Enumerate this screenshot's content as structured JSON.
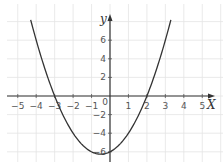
{
  "chart_data": {
    "type": "line",
    "title": "",
    "xlabel": "X",
    "ylabel": "y",
    "function": "y = x^2 + x - 6",
    "xlim": [
      -5.5,
      5.7
    ],
    "ylim": [
      -7,
      8.5
    ],
    "x_ticks": [
      -5,
      -4,
      -3,
      -2,
      -1,
      0,
      1,
      2,
      3,
      4,
      5
    ],
    "x_tick_labels": [
      "−5",
      "−4",
      "−3",
      "−2",
      "−1",
      "0",
      "1",
      "2",
      "3",
      "4",
      "5"
    ],
    "y_ticks": [
      -6,
      -4,
      -2,
      2,
      4,
      6
    ],
    "y_tick_labels": [
      "−6",
      "−4",
      "−2",
      "2",
      "4",
      "6"
    ],
    "grid": true,
    "grid_x_step": 1,
    "grid_y_step": 2,
    "legend": null,
    "series": [
      {
        "name": "parabola",
        "x": [
          -4.3,
          -4,
          -3.5,
          -3,
          -2.5,
          -2,
          -1.5,
          -1,
          -0.5,
          0,
          0.5,
          1,
          1.5,
          2,
          2.5,
          3,
          3.3
        ],
        "y": [
          8.19,
          6,
          2.75,
          0,
          -2.25,
          -4,
          -5.25,
          -6,
          -6.25,
          -6,
          -5.25,
          -4,
          -2.25,
          0,
          2.75,
          6,
          8.19
        ]
      }
    ],
    "key_points": {
      "x_intercepts": [
        -3,
        2
      ],
      "y_intercept": -6,
      "vertex": [
        -0.5,
        -6.25
      ]
    },
    "colors": {
      "curve": "#333333",
      "axes": "#333333",
      "grid": "#e4e4e4",
      "labels": "#555555"
    }
  },
  "layout": {
    "origin_px": [
      110,
      96
    ],
    "x_px_per_unit": 18.45,
    "y_px_per_unit": 9.3
  }
}
